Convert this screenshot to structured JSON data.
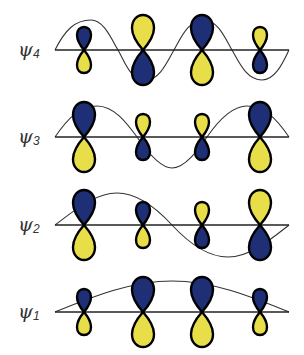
{
  "diagram": {
    "colors": {
      "positive_lobe": "#1e2f75",
      "negative_lobe": "#e8de4a",
      "outline": "#000000",
      "axis": "#222222",
      "wave": "#333333"
    },
    "axis_x_start": 55,
    "axis_x_end": 289,
    "atom_x": [
      84,
      143,
      202,
      260
    ],
    "orbitals": [
      {
        "label": "ψ",
        "subscript": "4",
        "baseline_y": 50,
        "nodes": 3,
        "lobes": [
          {
            "top": "blue",
            "bottom": "yellow",
            "size": "small"
          },
          {
            "top": "yellow",
            "bottom": "blue",
            "size": "large"
          },
          {
            "top": "blue",
            "bottom": "yellow",
            "size": "large"
          },
          {
            "top": "yellow",
            "bottom": "blue",
            "size": "small"
          }
        ]
      },
      {
        "label": "ψ",
        "subscript": "3",
        "baseline_y": 137,
        "nodes": 2,
        "lobes": [
          {
            "top": "blue",
            "bottom": "yellow",
            "size": "large"
          },
          {
            "top": "yellow",
            "bottom": "blue",
            "size": "small"
          },
          {
            "top": "yellow",
            "bottom": "blue",
            "size": "small"
          },
          {
            "top": "blue",
            "bottom": "yellow",
            "size": "large"
          }
        ]
      },
      {
        "label": "ψ",
        "subscript": "2",
        "baseline_y": 225,
        "nodes": 1,
        "lobes": [
          {
            "top": "blue",
            "bottom": "yellow",
            "size": "large"
          },
          {
            "top": "blue",
            "bottom": "yellow",
            "size": "small"
          },
          {
            "top": "yellow",
            "bottom": "blue",
            "size": "small"
          },
          {
            "top": "yellow",
            "bottom": "blue",
            "size": "large"
          }
        ]
      },
      {
        "label": "ψ",
        "subscript": "1",
        "baseline_y": 312,
        "nodes": 0,
        "lobes": [
          {
            "top": "blue",
            "bottom": "yellow",
            "size": "small"
          },
          {
            "top": "blue",
            "bottom": "yellow",
            "size": "large"
          },
          {
            "top": "blue",
            "bottom": "yellow",
            "size": "large"
          },
          {
            "top": "blue",
            "bottom": "yellow",
            "size": "small"
          }
        ]
      }
    ]
  }
}
